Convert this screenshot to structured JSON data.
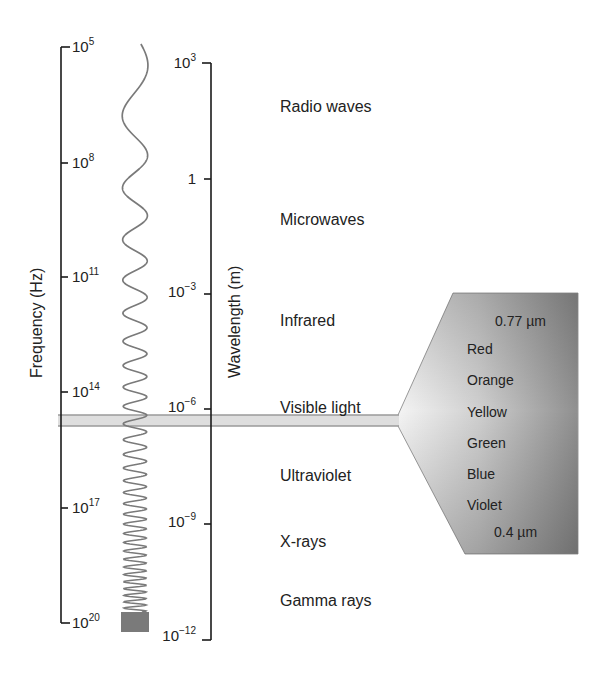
{
  "diagram": {
    "frequency_axis": {
      "title": "Frequency (Hz)",
      "ticks": [
        {
          "base": "10",
          "exp": "5"
        },
        {
          "base": "10",
          "exp": "8"
        },
        {
          "base": "10",
          "exp": "11"
        },
        {
          "base": "10",
          "exp": "14"
        },
        {
          "base": "10",
          "exp": "17"
        },
        {
          "base": "10",
          "exp": "20"
        }
      ]
    },
    "wavelength_axis": {
      "title": "Wavelength (m)",
      "ticks": [
        {
          "base": "10",
          "exp": "3"
        },
        {
          "base": "1",
          "exp": ""
        },
        {
          "base": "10",
          "exp": "−3"
        },
        {
          "base": "10",
          "exp": "−6"
        },
        {
          "base": "10",
          "exp": "−9"
        },
        {
          "base": "10",
          "exp": "−12"
        }
      ]
    },
    "regions": [
      "Radio waves",
      "Microwaves",
      "Infrared",
      "Visible light",
      "Ultraviolet",
      "X-rays",
      "Gamma rays"
    ],
    "visible_detail": {
      "top_wavelength": "0.77 µm",
      "colors": [
        "Red",
        "Orange",
        "Yellow",
        "Green",
        "Blue",
        "Violet"
      ],
      "bottom_wavelength": "0.4 µm"
    },
    "style": {
      "line_color": "#1a1a1a",
      "wave_color": "#777777",
      "band_fill": "#dcdcdc",
      "band_stroke": "#999999",
      "trapezoid_light": "#f2f2f2",
      "trapezoid_dark": "#8a8a8a"
    }
  }
}
